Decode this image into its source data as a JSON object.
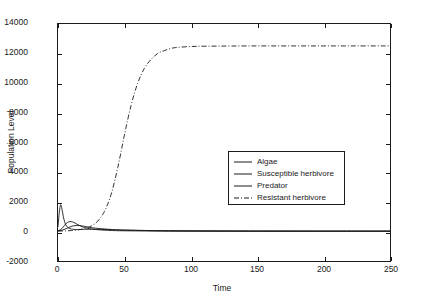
{
  "chart_data": {
    "type": "line",
    "title": "",
    "xlabel": "Time",
    "ylabel": "Population Level",
    "xlim": [
      0,
      250
    ],
    "ylim": [
      -2000,
      14000
    ],
    "xticks": [
      0,
      50,
      100,
      150,
      200,
      250
    ],
    "yticks": [
      -2000,
      0,
      2000,
      4000,
      6000,
      8000,
      10000,
      12000,
      14000
    ],
    "grid": false,
    "legend_position": "center-right",
    "series": [
      {
        "name": "Algae",
        "style": "solid",
        "color": "#1a1a1a",
        "x": [
          0,
          1,
          2,
          3,
          4,
          5,
          6,
          7,
          8,
          10,
          12,
          15,
          20,
          25,
          30,
          40,
          50,
          75,
          100,
          150,
          200,
          250
        ],
        "values": [
          300,
          1300,
          1800,
          1500,
          1000,
          650,
          420,
          300,
          230,
          160,
          130,
          120,
          140,
          150,
          140,
          110,
          80,
          45,
          30,
          20,
          18,
          18
        ]
      },
      {
        "name": "Susceptible herbivore",
        "style": "solid",
        "color": "#1a1a1a",
        "x": [
          0,
          2,
          4,
          6,
          8,
          10,
          12,
          14,
          16,
          18,
          20,
          25,
          30,
          40,
          50,
          75,
          100,
          150,
          200,
          250
        ],
        "values": [
          50,
          120,
          300,
          520,
          640,
          660,
          600,
          500,
          400,
          320,
          260,
          160,
          110,
          60,
          40,
          20,
          12,
          6,
          4,
          3
        ]
      },
      {
        "name": "Predator",
        "style": "solid",
        "color": "#1a1a1a",
        "x": [
          0,
          3,
          6,
          9,
          12,
          15,
          18,
          21,
          25,
          30,
          40,
          50,
          75,
          100,
          150,
          200,
          250
        ],
        "values": [
          30,
          80,
          180,
          300,
          380,
          400,
          370,
          320,
          260,
          200,
          130,
          90,
          50,
          35,
          25,
          20,
          20
        ]
      },
      {
        "name": "Resistant herbivore",
        "style": "dash-dot",
        "color": "#1a1a1a",
        "x": [
          0,
          5,
          10,
          15,
          20,
          25,
          30,
          35,
          40,
          45,
          50,
          55,
          60,
          65,
          70,
          75,
          80,
          85,
          90,
          100,
          110,
          125,
          150,
          175,
          200,
          225,
          250
        ],
        "values": [
          20,
          30,
          55,
          100,
          190,
          360,
          700,
          1350,
          2500,
          4300,
          6500,
          8500,
          10000,
          11000,
          11600,
          12000,
          12200,
          12350,
          12420,
          12480,
          12500,
          12510,
          12520,
          12520,
          12520,
          12520,
          12520
        ]
      }
    ]
  },
  "axes": {
    "ylabel": "Population Level",
    "xlabel": "Time",
    "ytick_labels": [
      "14000",
      "12000",
      "10000",
      "8000",
      "6000",
      "4000",
      "2000",
      "0",
      "-2000"
    ],
    "xtick_labels": [
      "0",
      "50",
      "100",
      "150",
      "200",
      "250"
    ]
  },
  "legend": {
    "items": [
      {
        "label": "Algae",
        "style": "solid"
      },
      {
        "label": "Susceptible herbivore",
        "style": "solid"
      },
      {
        "label": "Predator",
        "style": "solid"
      },
      {
        "label": "Resistant herbivore",
        "style": "dash-dot"
      }
    ]
  },
  "colors": {
    "line": "#1a1a1a",
    "axis": "#1a1a1a",
    "background": "#ffffff"
  }
}
